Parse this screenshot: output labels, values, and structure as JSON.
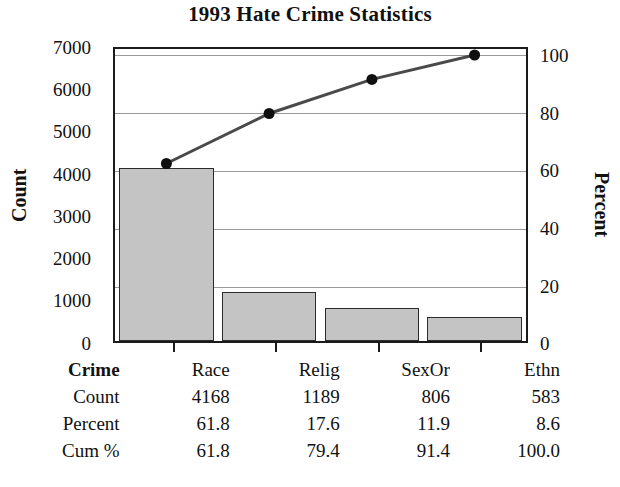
{
  "chart_data": {
    "type": "bar",
    "title": "1993 Hate Crime Statistics",
    "subtype": "pareto",
    "categories": [
      "Race",
      "Relig",
      "SexOr",
      "Ethn"
    ],
    "values": [
      4168,
      1189,
      806,
      583
    ],
    "series": [
      {
        "name": "Count",
        "values": [
          4168,
          1189,
          806,
          583
        ],
        "axis": "left"
      },
      {
        "name": "Cum %",
        "values": [
          61.8,
          79.4,
          91.4,
          100.0
        ],
        "axis": "right",
        "type": "line"
      }
    ],
    "percent": [
      61.8,
      17.6,
      11.9,
      8.6
    ],
    "xlabel": "Crime",
    "ylabel": "Count",
    "y2label": "Percent",
    "ylim": [
      0,
      7000
    ],
    "y2lim": [
      0,
      100
    ],
    "yticks": [
      "0",
      "1000",
      "2000",
      "3000",
      "4000",
      "5000",
      "6000",
      "7000"
    ],
    "ytick_values": [
      0,
      1000,
      2000,
      3000,
      4000,
      5000,
      6000,
      7000
    ],
    "y2ticks": [
      "0",
      "20",
      "40",
      "60",
      "80",
      "100"
    ],
    "y2tick_values": [
      0,
      20,
      40,
      60,
      80,
      100
    ],
    "grid": "horizontal-on-percent-axis",
    "legend": "none",
    "bar_color": "#c4c4c4",
    "bar_edge_color": "#2b2b2b",
    "line_color": "#4a4a4a",
    "marker_color": "#101010"
  },
  "table": {
    "rows": [
      {
        "label": "Crime",
        "bold": true,
        "values": [
          "Race",
          "Relig",
          "SexOr",
          "Ethn"
        ]
      },
      {
        "label": "Count",
        "bold": false,
        "values": [
          "4168",
          "1189",
          "806",
          "583"
        ]
      },
      {
        "label": "Percent",
        "bold": false,
        "values": [
          "61.8",
          "17.6",
          "11.9",
          "8.6"
        ]
      },
      {
        "label": "Cum %",
        "bold": false,
        "values": [
          "61.8",
          "79.4",
          "91.4",
          "100.0"
        ]
      }
    ]
  }
}
